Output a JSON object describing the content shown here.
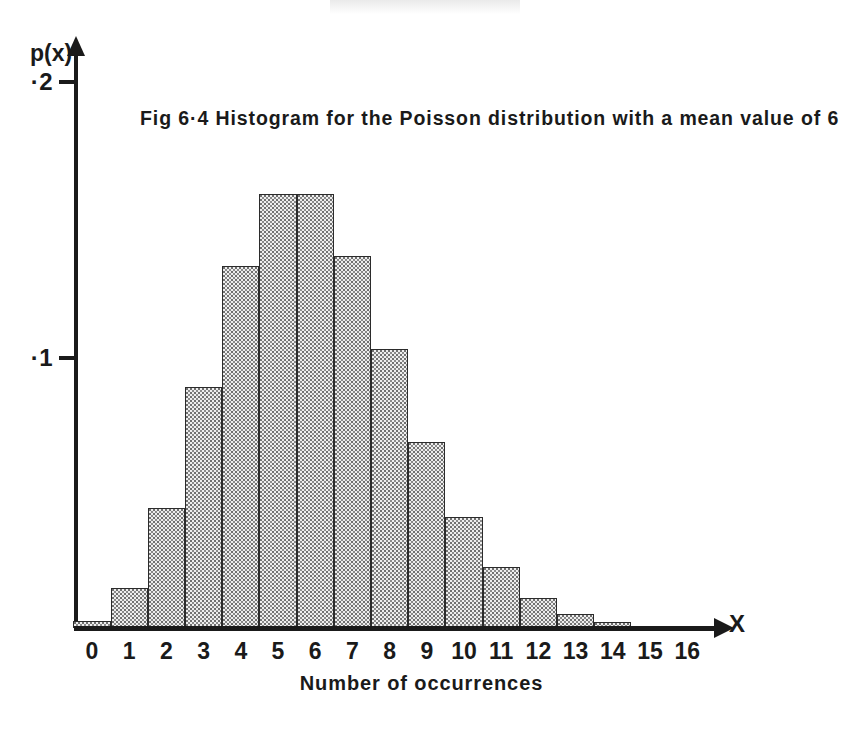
{
  "figure": {
    "title": "Fig 6·4   Histogram for the Poisson distribution with a mean value of 6",
    "x_caption": "Number of occurrences",
    "y_axis_name": "p(x)",
    "x_axis_name": "X",
    "y_tick_labels": [
      "·1",
      "·2"
    ],
    "colors": {
      "ink": "#1a1a1a",
      "bar_fill": "#eeeeee",
      "bar_edge": "#2b2b2b",
      "paper": "#ffffff"
    }
  },
  "chart_data": {
    "type": "bar",
    "title": "Fig 6·4   Histogram for the Poisson distribution with a mean value of 6",
    "subtitle": "",
    "xlabel": "Number of occurrences",
    "ylabel": "p(x)",
    "categories": [
      "0",
      "1",
      "2",
      "3",
      "4",
      "5",
      "6",
      "7",
      "8",
      "9",
      "10",
      "11",
      "12",
      "13",
      "14",
      "15",
      "16"
    ],
    "x": [
      0,
      1,
      2,
      3,
      4,
      5,
      6,
      7,
      8,
      9,
      10,
      11,
      12,
      13,
      14,
      15,
      16
    ],
    "values": [
      0.0025,
      0.0149,
      0.0446,
      0.0892,
      0.1339,
      0.1606,
      0.1606,
      0.1377,
      0.1033,
      0.0688,
      0.0413,
      0.0225,
      0.0113,
      0.0052,
      0.0022,
      0.0009,
      0.0003
    ],
    "distribution": "Poisson",
    "mean": 6,
    "xlim": [
      -0.5,
      16.8
    ],
    "ylim": [
      0,
      0.205
    ],
    "yticks": [
      0.1,
      0.2
    ],
    "ytick_labels": [
      "·1",
      "·2"
    ],
    "xticks": [
      0,
      1,
      2,
      3,
      4,
      5,
      6,
      7,
      8,
      9,
      10,
      11,
      12,
      13,
      14,
      15,
      16
    ],
    "grid": false,
    "legend": false,
    "legend_position": "none",
    "bar_fill_pattern": "stipple-dots",
    "annotations": []
  }
}
